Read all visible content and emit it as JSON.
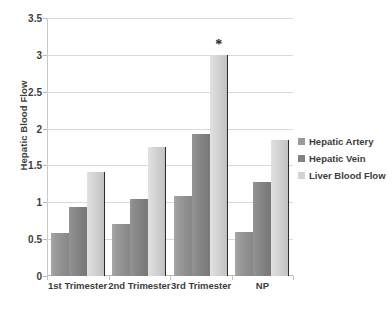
{
  "chart_data": {
    "type": "bar",
    "title": "",
    "xlabel": "",
    "ylabel": "Hepatic Blood Flow",
    "ylim": [
      0,
      3.5
    ],
    "ytick_labels": [
      "0",
      "0.5",
      "1",
      "1.5",
      "2",
      "2.5",
      "3",
      "3.5"
    ],
    "ytick_values": [
      0,
      0.5,
      1,
      1.5,
      2,
      2.5,
      3,
      3.5
    ],
    "grid": true,
    "legend_position": "right",
    "categories": [
      "1st Trimester",
      "2nd Trimester",
      "3rd Trimester",
      "NP"
    ],
    "series": [
      {
        "name": "Hepatic Artery",
        "color": "#9a9a9a",
        "values": [
          0.58,
          0.71,
          1.08,
          0.6
        ]
      },
      {
        "name": "Hepatic Vein",
        "color": "#828282",
        "values": [
          0.93,
          1.05,
          1.93,
          1.28
        ]
      },
      {
        "name": "Liver Blood Flow",
        "color": "#d2d2d2",
        "values": [
          1.41,
          1.75,
          3.0,
          1.84
        ]
      }
    ],
    "annotations": [
      {
        "text": "*",
        "category": "3rd Trimester",
        "series": "Liver Blood Flow",
        "value": 3.0
      }
    ]
  },
  "legend": {
    "items": [
      {
        "label": "Hepatic Artery"
      },
      {
        "label": "Hepatic Vein"
      },
      {
        "label": "Liver Blood Flow"
      }
    ]
  }
}
